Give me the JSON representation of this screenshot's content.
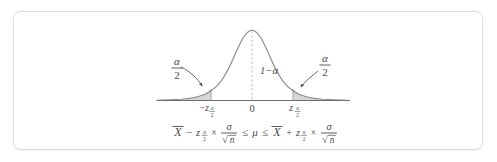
{
  "figure": {
    "curve": {
      "type": "normal-density",
      "mean": 0,
      "center_label": "0",
      "peak_label": "",
      "axis_visible": true,
      "center_dashed_line": true
    },
    "labels": {
      "left_tail_numerator": "α",
      "left_tail_denominator": "2",
      "right_tail_numerator": "α",
      "right_tail_denominator": "2",
      "center_region": "1−α",
      "axis_left_tick": "−z",
      "axis_left_tick_sub_num": "α",
      "axis_left_tick_sub_den": "2",
      "axis_center_tick": "0",
      "axis_right_tick": "z",
      "axis_right_tick_sub_num": "α",
      "axis_right_tick_sub_den": "2"
    },
    "formula": {
      "full_text": "X̄ − z(α/2) × σ/√n ≤ μ ≤ X̄ + z(α/2) × σ/√n",
      "left_mean": "X",
      "left_operator": "−",
      "left_z": "z",
      "left_z_sub_num": "α",
      "left_z_sub_den": "2",
      "left_times": "×",
      "left_num": "σ",
      "left_den_radical": "√",
      "left_den": "n",
      "first_inequality": "≤",
      "parameter": "μ",
      "second_inequality": "≤",
      "right_mean": "X",
      "right_operator": "+",
      "right_z": "z",
      "right_z_sub_num": "α",
      "right_z_sub_den": "2",
      "right_times": "×",
      "right_num": "σ",
      "right_den_radical": "√",
      "right_den": "n"
    },
    "colors": {
      "curve_stroke": "#8a8a8a",
      "axis_stroke": "#6e6e6e",
      "shade_fill": "#d6d6d6",
      "shade_stroke": "#9a9a9a",
      "text": "#4a4a4a",
      "card_border": "#dcdcdc",
      "background": "#ffffff",
      "dashed_line": "#b0b0b0",
      "arrow": "#555555"
    },
    "geometry": {
      "axis_y": 100,
      "axis_x_start": 157,
      "axis_x_end": 350,
      "peak_x": 252,
      "peak_y": 30,
      "left_bound_x": 211,
      "right_bound_x": 293
    }
  }
}
